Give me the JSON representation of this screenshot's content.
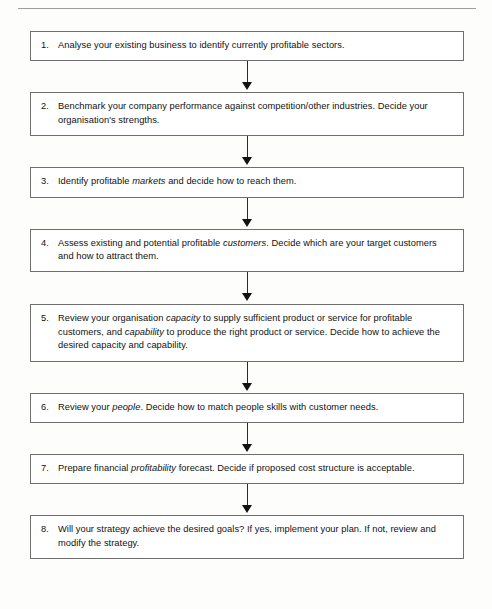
{
  "diagram": {
    "type": "flowchart",
    "orientation": "vertical-top-to-bottom",
    "connector_label": "down-arrow",
    "steps": [
      {
        "number": "1.",
        "segments": [
          {
            "text": "Analyse your existing business to identify currently profitable sectors.",
            "italic": false
          }
        ]
      },
      {
        "number": "2.",
        "segments": [
          {
            "text": "Benchmark your company performance against competition/other industries. Decide your organisation's strengths.",
            "italic": false
          }
        ]
      },
      {
        "number": "3.",
        "segments": [
          {
            "text": "Identify profitable ",
            "italic": false
          },
          {
            "text": "markets",
            "italic": true
          },
          {
            "text": " and decide how to reach them.",
            "italic": false
          }
        ]
      },
      {
        "number": "4.",
        "segments": [
          {
            "text": "Assess existing and potential profitable ",
            "italic": false
          },
          {
            "text": "customers",
            "italic": true
          },
          {
            "text": ". Decide which are your target customers and how to attract them.",
            "italic": false
          }
        ]
      },
      {
        "number": "5.",
        "segments": [
          {
            "text": "Review your organisation ",
            "italic": false
          },
          {
            "text": "capacity",
            "italic": true
          },
          {
            "text": " to supply sufficient product or service for profitable customers, and ",
            "italic": false
          },
          {
            "text": "capability",
            "italic": true
          },
          {
            "text": " to produce the right product or service. Decide how to achieve the desired capacity and capability.",
            "italic": false
          }
        ]
      },
      {
        "number": "6.",
        "segments": [
          {
            "text": "Review your ",
            "italic": false
          },
          {
            "text": "people",
            "italic": true
          },
          {
            "text": ". Decide how to match people skills with customer needs.",
            "italic": false
          }
        ]
      },
      {
        "number": "7.",
        "segments": [
          {
            "text": "Prepare financial ",
            "italic": false
          },
          {
            "text": "profitability",
            "italic": true
          },
          {
            "text": " forecast. Decide if proposed cost structure is acceptable.",
            "italic": false
          }
        ]
      },
      {
        "number": "8.",
        "segments": [
          {
            "text": "Will your strategy achieve the desired goals? If yes, implement your plan. If not, review and modify the strategy.",
            "italic": false
          }
        ]
      }
    ]
  },
  "colors": {
    "box_border": "#6f6f6f",
    "arrow": "#121212",
    "text": "#111111",
    "page_background": "#fdfdfc",
    "top_rule": "#8e8e8e"
  }
}
